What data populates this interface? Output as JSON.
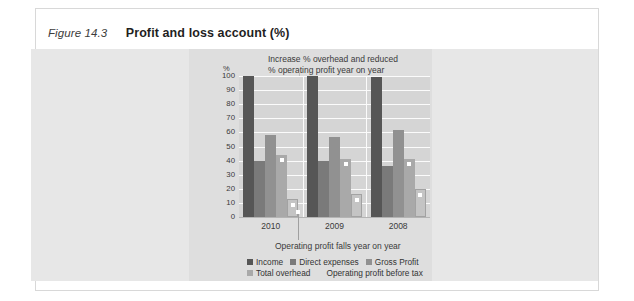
{
  "figure": {
    "number": "Figure 14.3",
    "title": "Profit and loss account (%)"
  },
  "annotations": {
    "top_line1": "Increase % overhead and reduced",
    "top_line2": "% operating profit year on year",
    "bottom": "Operating profit falls year on year"
  },
  "colors": {
    "income": "#565656",
    "direct_expenses": "#7a7a7a",
    "gross_profit": "#919191",
    "total_overhead": "#a9a9a9",
    "operating_profit": "#c4c4c4",
    "plot_background": "#d5d5d5",
    "chart_background": "#e7e7e7",
    "inner_background": "#dedede",
    "gridline": "#fbfbfb",
    "frame_border": "#d8d8d8"
  },
  "chart_data": {
    "type": "bar",
    "title": "Profit and loss account (%)",
    "xlabel": "",
    "ylabel": "%",
    "ylim": [
      0,
      100
    ],
    "yticks": [
      100,
      90,
      80,
      70,
      60,
      50,
      40,
      30,
      20,
      10,
      0
    ],
    "grid": true,
    "legend_position": "bottom",
    "categories": [
      "2010",
      "2009",
      "2008"
    ],
    "series": [
      {
        "name": "Income",
        "values": [
          100,
          100,
          99
        ]
      },
      {
        "name": "Direct expenses",
        "values": [
          40,
          40,
          36
        ]
      },
      {
        "name": "Gross Profit",
        "values": [
          58,
          57,
          62
        ]
      },
      {
        "name": "Total overhead",
        "values": [
          44,
          41,
          41
        ]
      },
      {
        "name": "Operating profit before tax",
        "values": [
          13,
          16,
          20
        ]
      }
    ],
    "annotations": [
      "Increase % overhead and reduced % operating profit year on year",
      "Operating profit falls year on year"
    ]
  }
}
